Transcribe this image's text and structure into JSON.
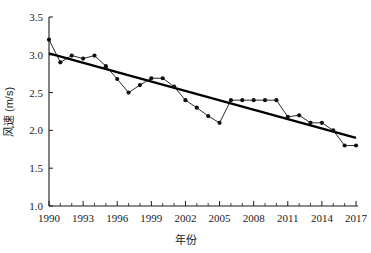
{
  "chart_data": {
    "type": "line",
    "title": "",
    "xlabel": "年份",
    "ylabel": "风速 (m/s)",
    "xlim": [
      1990,
      2017
    ],
    "ylim": [
      1.0,
      3.5
    ],
    "grid": false,
    "legend": "none",
    "x_tick_labels": [
      "1990",
      "1993",
      "1996",
      "1999",
      "2002",
      "2005",
      "2008",
      "2011",
      "2014",
      "2017"
    ],
    "x_tick_values": [
      1990,
      1993,
      1996,
      1999,
      2002,
      2005,
      2008,
      2011,
      2014,
      2017
    ],
    "y_tick_labels": [
      "1.0",
      "1.5",
      "2.0",
      "2.5",
      "3.0",
      "3.5"
    ],
    "y_tick_values": [
      1.0,
      1.5,
      2.0,
      2.5,
      3.0,
      3.5
    ],
    "x": [
      1990,
      1991,
      1992,
      1993,
      1994,
      1995,
      1996,
      1997,
      1998,
      1999,
      2000,
      2001,
      2002,
      2003,
      2004,
      2005,
      2006,
      2007,
      2008,
      2009,
      2010,
      2011,
      2012,
      2013,
      2014,
      2015,
      2016,
      2017
    ],
    "series": [
      {
        "name": "风速",
        "marker": "circle",
        "values": [
          3.2,
          2.9,
          2.99,
          2.95,
          2.99,
          2.85,
          2.68,
          2.5,
          2.6,
          2.69,
          2.69,
          2.58,
          2.4,
          2.3,
          2.19,
          2.1,
          2.4,
          2.4,
          2.4,
          2.4,
          2.4,
          2.18,
          2.2,
          2.1,
          2.1,
          2.0,
          1.8,
          1.8
        ]
      },
      {
        "name": "线性趋势线",
        "marker": "none",
        "is_trend": true,
        "endpoints": [
          {
            "x": 1990,
            "y": 3.02
          },
          {
            "x": 2017,
            "y": 1.9
          }
        ]
      }
    ]
  },
  "axis": {
    "x_title": "年份",
    "y_title": "风速 (m/s)"
  }
}
